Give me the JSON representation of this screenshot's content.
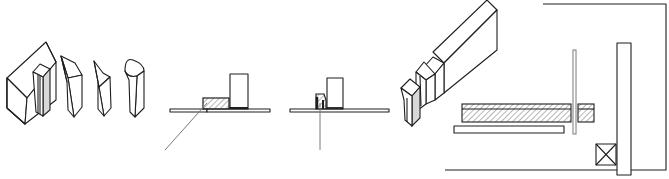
{
  "figure": {
    "width": 669,
    "height": 179,
    "background": "#ffffff",
    "line_color": "#1e1e1e",
    "hatch_color": "#6e6e6e",
    "panels": [
      {
        "id": "isometric-blocks",
        "description": "House-shaped block with inserted shaded post, followed by three cut wooden pieces"
      },
      {
        "id": "section-a",
        "description": "Cross-section: flat board with hatched block, upright block, angled line pointing to joint"
      },
      {
        "id": "section-b",
        "description": "Cross-section: flat board with small notched hatched piece, upright block, vertical line"
      },
      {
        "id": "isometric-beam",
        "description": "Long angled beam with stepped end pieces"
      },
      {
        "id": "plan-view",
        "description": "Plan: L-shaped outline, tall vertical bar, hatched horizontal strips, thin rod, plain strip, crossed square"
      }
    ]
  }
}
